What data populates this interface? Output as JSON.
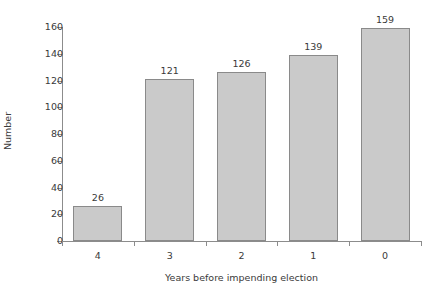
{
  "chart_data": {
    "type": "bar",
    "title": "",
    "xlabel": "Years before impending election",
    "ylabel": "Number",
    "categories": [
      "4",
      "3",
      "2",
      "1",
      "0"
    ],
    "values": [
      26,
      121,
      126,
      139,
      159
    ],
    "value_labels": [
      "26",
      "121",
      "126",
      "139",
      "159"
    ],
    "ylim": [
      0,
      160
    ],
    "ytick_labels": [
      "160",
      "140",
      "120",
      "100",
      "80",
      "60",
      "40",
      "20",
      "0"
    ],
    "ytick_values": [
      160,
      140,
      120,
      100,
      80,
      60,
      40,
      20,
      0
    ],
    "grid": false,
    "legend": false,
    "legend_position": "none",
    "series": [
      {
        "name": "Number",
        "values": [
          26,
          121,
          126,
          139,
          159
        ]
      }
    ],
    "colors": {
      "bar_fill": "#cacaca",
      "bar_border": "#8a8a8a",
      "axis": "#8c8c8c",
      "text": "#3a3a3a",
      "background": "#ffffff"
    }
  }
}
